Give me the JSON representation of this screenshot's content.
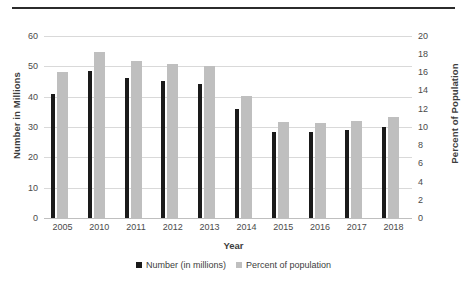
{
  "chart_data": {
    "type": "bar",
    "title": "",
    "subtitle": "",
    "xlabel": "Year",
    "ylabel": "Number in Millions",
    "y2label": "Percent of Population",
    "categories": [
      "2005",
      "2010",
      "2011",
      "2012",
      "2013",
      "2014",
      "2015",
      "2016",
      "2017",
      "2018"
    ],
    "series": [
      {
        "name": "Number (in millions)",
        "axis": "left",
        "color": "#1a1a1a",
        "values": [
          41.0,
          48.5,
          46.0,
          45.3,
          44.3,
          35.8,
          28.3,
          28.2,
          29.0,
          30.0
        ]
      },
      {
        "name": "Percent of population",
        "axis": "right",
        "color": "#bfbfbf",
        "values": [
          16.0,
          18.2,
          17.3,
          16.9,
          16.7,
          13.4,
          10.5,
          10.4,
          10.7,
          11.1
        ]
      }
    ],
    "ylim": [
      0,
      60
    ],
    "yticks": [
      0,
      10,
      20,
      30,
      40,
      50,
      60
    ],
    "y2lim": [
      0,
      20
    ],
    "y2ticks": [
      0,
      2,
      4,
      6,
      8,
      10,
      12,
      14,
      16,
      18,
      20
    ],
    "grid": true,
    "legend_position": "bottom"
  },
  "axes": {
    "left_ticks": [
      "60",
      "50",
      "40",
      "30",
      "20",
      "10",
      "0"
    ],
    "right_ticks": [
      "20",
      "18",
      "16",
      "14",
      "12",
      "10",
      "8",
      "6",
      "4",
      "2",
      "0"
    ],
    "left_title": "Number in Millions",
    "right_title": "Percent of Population",
    "x_title": "Year"
  },
  "legend": {
    "items": [
      {
        "label": "Number (in millions)",
        "color": "#1a1a1a"
      },
      {
        "label": "Percent of population",
        "color": "#bfbfbf"
      }
    ]
  }
}
